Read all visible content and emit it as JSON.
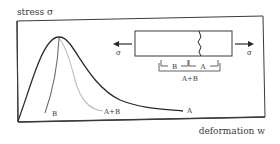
{
  "diagram": {
    "y_axis_label": "stress σ",
    "x_axis_label": "deformation w",
    "curves": [
      {
        "id": "A",
        "label": "A",
        "color": "#2a2a2a",
        "description": "total stress-deformation curve with softening tail"
      },
      {
        "id": "B",
        "label": "B",
        "color": "#6e6e6e",
        "description": "unloading branch of region B"
      },
      {
        "id": "AB",
        "label": "A+B",
        "color": "#b8b8b8",
        "description": "combined response of regions A and B"
      }
    ],
    "inset": {
      "left_arrow_label": "σ",
      "right_arrow_label": "σ",
      "segment_b_label": "B",
      "segment_a_label": "A",
      "segment_ab_label": "A+B"
    },
    "colors": {
      "frame": "#3a3a3a",
      "text": "#3a3a3a",
      "background": "#ffffff"
    }
  }
}
